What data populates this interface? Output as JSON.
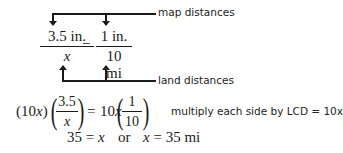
{
  "diagram": {
    "top_label": "map distances",
    "bottom_label": "land distances",
    "proportion": {
      "left": {
        "numerator": "3.5 in.",
        "denominator": "x"
      },
      "equals": "=",
      "right": {
        "numerator": "1 in.",
        "denominator": "10 mi"
      }
    }
  },
  "step1": {
    "left_factor": "(10x)",
    "left_frac": {
      "numerator": "3.5",
      "denominator": "x"
    },
    "equals": "=",
    "right_factor": "10x",
    "right_frac": {
      "numerator": "1",
      "denominator": "10"
    },
    "note": "multiply each side by LCD = 10x"
  },
  "step2": {
    "text_left": "35 = x",
    "or": "or",
    "text_right": "x = 35 mi"
  }
}
